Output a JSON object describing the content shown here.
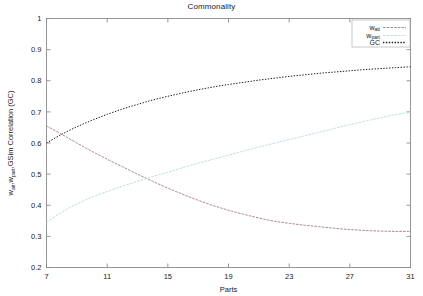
{
  "chart_data": {
    "type": "line",
    "title": "Commonality",
    "xlabel": "Parts",
    "ylabel": "w_att,w_part,GSim Correlation (GC)",
    "ylabel_parts": {
      "seg1": "w",
      "sub1": "att",
      "seg2": ",w",
      "sub2": "part",
      "seg3": ",GSim Correlation (GC)"
    },
    "xlim": [
      7,
      31
    ],
    "ylim": [
      0.2,
      1.0
    ],
    "xticks": [
      7,
      11,
      15,
      19,
      23,
      27,
      31
    ],
    "xtick_labels": [
      "7",
      "11",
      "15",
      "19",
      "23",
      "27",
      "31"
    ],
    "yticks": [
      0.2,
      0.3,
      0.4,
      0.5,
      0.6,
      0.7,
      0.8,
      0.9,
      1.0
    ],
    "ytick_labels": [
      "0.2",
      "0.3",
      "0.4",
      "0.5",
      "0.6",
      "0.7",
      "0.8",
      "0.9",
      "1"
    ],
    "grid": false,
    "legend_position": "top-right",
    "x": [
      7,
      8,
      9,
      10,
      11,
      12,
      13,
      14,
      15,
      16,
      17,
      18,
      19,
      20,
      21,
      22,
      23,
      24,
      25,
      26,
      27,
      28,
      29,
      30,
      31
    ],
    "series": [
      {
        "name": "w_att",
        "label_main": "w",
        "label_sub": "att",
        "color": "#b08a96",
        "style": "solid-fine",
        "values": [
          0.655,
          0.628,
          0.6,
          0.573,
          0.548,
          0.524,
          0.5,
          0.477,
          0.455,
          0.435,
          0.416,
          0.399,
          0.384,
          0.371,
          0.359,
          0.349,
          0.342,
          0.336,
          0.331,
          0.326,
          0.322,
          0.319,
          0.317,
          0.316,
          0.316
        ]
      },
      {
        "name": "w_part",
        "label_main": "w",
        "label_sub": "part",
        "color": "#bfe0e4",
        "style": "solid-fine",
        "values": [
          0.345,
          0.378,
          0.404,
          0.426,
          0.444,
          0.461,
          0.477,
          0.492,
          0.506,
          0.521,
          0.535,
          0.548,
          0.561,
          0.574,
          0.587,
          0.599,
          0.611,
          0.623,
          0.635,
          0.647,
          0.659,
          0.67,
          0.681,
          0.691,
          0.699
        ]
      },
      {
        "name": "GC",
        "label_main": "GC",
        "label_sub": "",
        "color": "#1a1a1a",
        "style": "dotted",
        "values": [
          0.6,
          0.628,
          0.652,
          0.673,
          0.692,
          0.709,
          0.724,
          0.738,
          0.75,
          0.761,
          0.771,
          0.78,
          0.788,
          0.795,
          0.802,
          0.808,
          0.814,
          0.819,
          0.824,
          0.828,
          0.832,
          0.836,
          0.839,
          0.842,
          0.845
        ]
      }
    ]
  }
}
